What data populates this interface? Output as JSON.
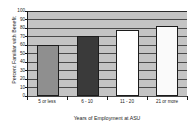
{
  "chart_data": {
    "type": "bar",
    "title": "",
    "categories": [
      "5 or less",
      "6 - 10",
      "11 - 20",
      "21 or more"
    ],
    "values": [
      60,
      71,
      78,
      82
    ],
    "series": [
      {
        "name": "Percent Familiar with Benefit",
        "values": [
          60,
          71,
          78,
          82
        ]
      }
    ],
    "xlabel": "Years of Employment at ASU",
    "ylabel": "Percent Familiar with Benefit",
    "ylim": [
      0,
      100
    ],
    "ytick_values": [
      0,
      10,
      20,
      30,
      40,
      50,
      60,
      70,
      80,
      90,
      100
    ],
    "ytick_labels": [
      "0",
      "10",
      "20",
      "30",
      "40",
      "50",
      "60",
      "70",
      "80",
      "90",
      "100"
    ],
    "grid": true,
    "grid_axis": "y",
    "legend": false,
    "legend_position": "none",
    "plot_background": "#c4c4c4",
    "bar_colors": [
      "#8f8f8f",
      "#3a3a3a",
      "#ffffff",
      "#fafafa"
    ],
    "bar_edge_color": "#1c1c1c",
    "axis_color": "#1a1a1a",
    "gridline_color": "#4a4a4a"
  }
}
